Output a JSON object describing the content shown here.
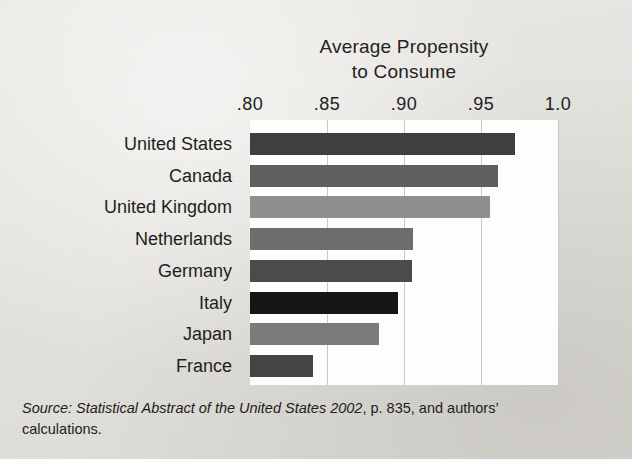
{
  "chart_data": {
    "type": "bar",
    "orientation": "horizontal",
    "title": "Average Propensity to Consume",
    "title_lines": [
      "Average Propensity",
      "to Consume"
    ],
    "xlabel": "",
    "ylabel": "",
    "xlim": [
      0.8,
      1.0
    ],
    "grid": true,
    "legend": "none",
    "tick_labels": [
      ".80",
      ".85",
      ".90",
      ".95",
      "1.0"
    ],
    "tick_values": [
      0.8,
      0.85,
      0.9,
      0.95,
      1.0
    ],
    "categories": [
      "United States",
      "Canada",
      "United Kingdom",
      "Netherlands",
      "Germany",
      "Italy",
      "Japan",
      "France"
    ],
    "values": [
      0.972,
      0.961,
      0.956,
      0.906,
      0.905,
      0.896,
      0.884,
      0.841
    ],
    "bar_colors": [
      "#3f3f3f",
      "#5f5f5f",
      "#8f8f8f",
      "#6d6d6d",
      "#4b4b4b",
      "#161616",
      "#7b7b7b",
      "#444444"
    ],
    "plot_background": "#fdfdfb",
    "gridline_color": "#c9c9c5"
  },
  "source_note": {
    "label": "Source:",
    "italic_title": "Statistical Abstract of the United States 2002",
    "page": ", p. 835, and authors’",
    "line2": "calculations.",
    "full_text": "Source: Statistical Abstract of the United States 2002, p. 835, and authors’ calculations."
  }
}
